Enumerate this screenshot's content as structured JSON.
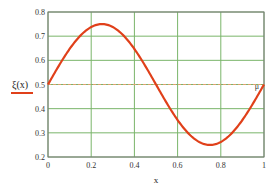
{
  "chart_data": {
    "type": "line",
    "title": "",
    "xlabel": "x",
    "ylabel": "ξ(x)",
    "xlim": [
      0,
      1
    ],
    "ylim": [
      0.2,
      0.8
    ],
    "grid": true,
    "x_ticks": [
      "0",
      "0.2",
      "0.4",
      "0.6",
      "0.8",
      "1"
    ],
    "y_ticks": [
      "0.2",
      "0.3",
      "0.4",
      "0.5",
      "0.6",
      "0.7",
      "0.8"
    ],
    "series": [
      {
        "name": "ξ(x)",
        "color": "#e0401a",
        "style": "solid",
        "x": [
          0,
          0.05,
          0.1,
          0.15,
          0.2,
          0.25,
          0.3,
          0.35,
          0.4,
          0.45,
          0.5,
          0.55,
          0.6,
          0.65,
          0.7,
          0.75,
          0.8,
          0.85,
          0.9,
          0.95,
          1.0
        ],
        "values": [
          0.5,
          0.577,
          0.647,
          0.702,
          0.738,
          0.75,
          0.738,
          0.702,
          0.647,
          0.577,
          0.5,
          0.423,
          0.353,
          0.298,
          0.262,
          0.25,
          0.262,
          0.298,
          0.353,
          0.423,
          0.5
        ]
      },
      {
        "name": "reference 0.5",
        "color": "#e0a070",
        "style": "dashed",
        "x": [
          0,
          1
        ],
        "values": [
          0.5,
          0.5
        ]
      }
    ],
    "annotations": [
      {
        "text": "μ",
        "x": 0.985,
        "y": 0.5
      }
    ],
    "colors": {
      "grid": "#7ab56a",
      "axis": "#555555",
      "curve": "#e0401a",
      "reference": "#e0a070"
    }
  },
  "labels": {
    "ylabel": "ξ(x)",
    "xlabel": "x",
    "marker": "μ"
  }
}
